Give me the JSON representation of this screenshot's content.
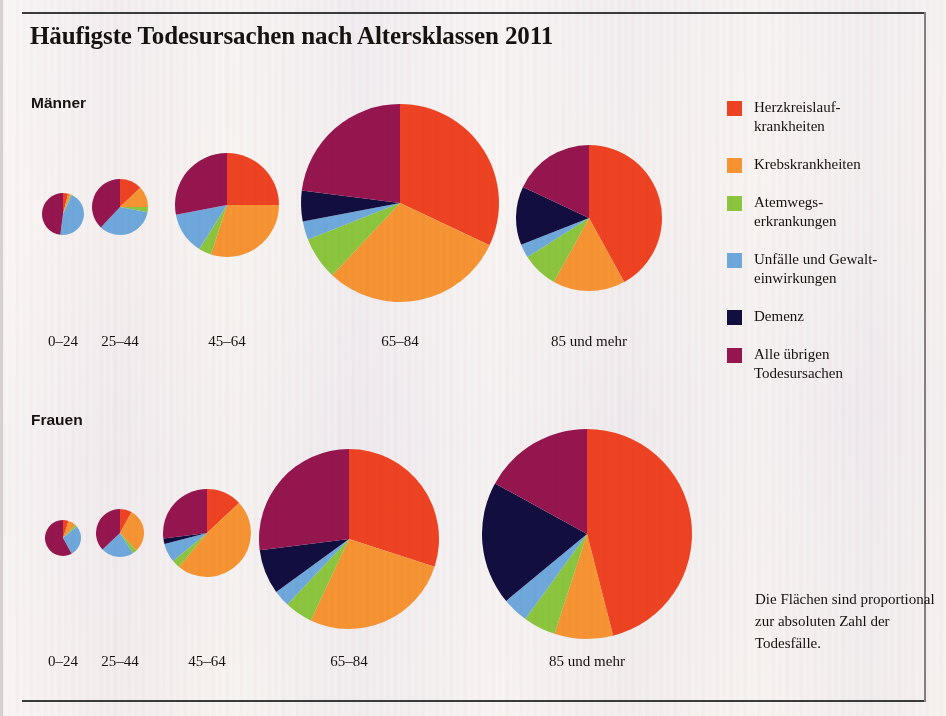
{
  "title": "Häufigste Todesursachen nach Altersklassen 2011",
  "panels": {
    "men_label": "Männer",
    "women_label": "Frauen"
  },
  "note": "Die Flächen sind proportional zur absoluten Zahl der Todesfälle.",
  "legend": {
    "items": [
      {
        "label": "Herzkreislauf-\nkrankheiten",
        "color": "#ee4323",
        "key": "herzkreislauf"
      },
      {
        "label": "Krebskrankheiten",
        "color": "#f79433",
        "key": "krebs"
      },
      {
        "label": "Atemwegs-\nerkrankungen",
        "color": "#8cc63e",
        "key": "atemwege"
      },
      {
        "label": "Unfälle und Gewalt-\neinwirkungen",
        "color": "#6fa8dc",
        "key": "unfaelle"
      },
      {
        "label": "Demenz",
        "color": "#120f40",
        "key": "demenz"
      },
      {
        "label": "Alle übrigen\nTodesursachen",
        "color": "#96164f",
        "key": "uebrige"
      }
    ]
  },
  "chart_data": {
    "type": "pie",
    "title": "Häufigste Todesursachen nach Altersklassen 2011",
    "subtitle": "Die Flächen sind proportional zur absoluten Zahl der Todesfälle.",
    "unit": "Anteil in Prozent",
    "categories": [
      "Herzkreislaufkrankheiten",
      "Krebskrankheiten",
      "Atemwegserkrankungen",
      "Unfälle und Gewalteinwirkungen",
      "Demenz",
      "Alle übrigen Todesursachen"
    ],
    "colors": [
      "#ee4323",
      "#f79433",
      "#8cc63e",
      "#6fa8dc",
      "#120f40",
      "#96164f"
    ],
    "age_groups": [
      "0–24",
      "25–44",
      "45–64",
      "65–84",
      "85 und mehr"
    ],
    "panels": [
      {
        "name": "Männer",
        "pies": [
          {
            "age": "0–24",
            "radius": 21,
            "values": [
              4,
              2,
              1,
              45,
              0,
              48
            ]
          },
          {
            "age": "25–44",
            "radius": 28,
            "values": [
              13,
              12,
              3,
              34,
              0,
              38
            ]
          },
          {
            "age": "45–64",
            "radius": 52,
            "values": [
              25,
              30,
              4,
              13,
              0,
              28
            ]
          },
          {
            "age": "65–84",
            "radius": 99,
            "values": [
              32,
              30,
              7,
              3,
              5,
              23
            ]
          },
          {
            "age": "85 und mehr",
            "radius": 73,
            "values": [
              42,
              16,
              8,
              3,
              13,
              18
            ]
          }
        ]
      },
      {
        "name": "Frauen",
        "pies": [
          {
            "age": "0–24",
            "radius": 18,
            "values": [
              5,
              7,
              2,
              28,
              0,
              58
            ]
          },
          {
            "age": "25–44",
            "radius": 24,
            "values": [
              8,
              30,
              3,
              22,
              0,
              37
            ]
          },
          {
            "age": "45–64",
            "radius": 44,
            "values": [
              13,
              48,
              3,
              7,
              2,
              27
            ]
          },
          {
            "age": "65–84",
            "radius": 90,
            "values": [
              30,
              27,
              5,
              3,
              8,
              27
            ]
          },
          {
            "age": "85 und mehr",
            "radius": 105,
            "values": [
              46,
              9,
              5,
              4,
              19,
              17
            ]
          }
        ]
      }
    ],
    "layout": {
      "legend_position": "right",
      "grid": false,
      "area_proportional": true
    }
  },
  "pie_positions": {
    "men": [
      {
        "cx": 63,
        "cy": 214
      },
      {
        "cx": 120,
        "cy": 207
      },
      {
        "cx": 227,
        "cy": 205
      },
      {
        "cx": 400,
        "cy": 203
      },
      {
        "cx": 589,
        "cy": 218
      }
    ],
    "women": [
      {
        "cx": 63,
        "cy": 538
      },
      {
        "cx": 120,
        "cy": 533
      },
      {
        "cx": 207,
        "cy": 533
      },
      {
        "cx": 349,
        "cy": 539
      },
      {
        "cx": 587,
        "cy": 534
      }
    ],
    "label_y_men": 333,
    "label_y_women": 653
  }
}
